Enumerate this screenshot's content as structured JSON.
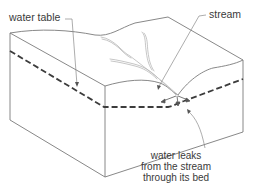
{
  "diagram": {
    "labels": {
      "water_table": "water table",
      "stream": "stream",
      "leak": {
        "line1": "water leaks",
        "line2": "from the stream",
        "line3": "through its bed"
      }
    },
    "colors": {
      "outline": "#7a7a7a",
      "water_table_dash": "#3c3c3c",
      "stream": "#b5b5b5",
      "leader": "#8a8a8a",
      "text": "#3a3a3a",
      "background": "#ffffff"
    }
  }
}
